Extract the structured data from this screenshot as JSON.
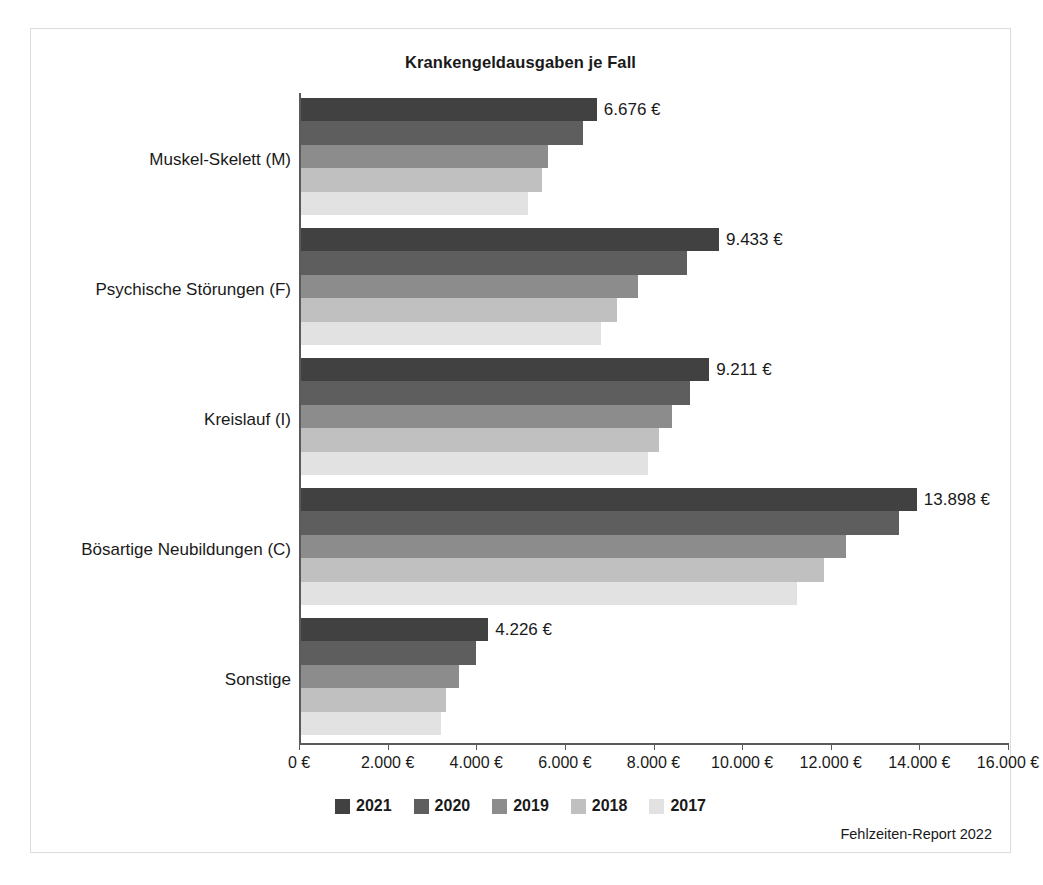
{
  "chart_data": {
    "type": "bar",
    "orientation": "horizontal",
    "title": "Krankengeldausgaben je Fall",
    "xlabel": "",
    "ylabel": "",
    "xlim": [
      0,
      16000
    ],
    "xticks": [
      0,
      2000,
      4000,
      6000,
      8000,
      10000,
      12000,
      14000,
      16000
    ],
    "xticklabels": [
      "0 €",
      "2.000 €",
      "4.000 €",
      "6.000 €",
      "8.000 €",
      "10.000 €",
      "12.000 €",
      "14.000 €",
      "16.000 €"
    ],
    "grid": false,
    "legend_position": "bottom",
    "categories": [
      "Muskel-Skelett (M)",
      "Psychische Störungen (F)",
      "Kreislauf (I)",
      "Bösartige Neubildungen (C)",
      "Sonstige"
    ],
    "series": [
      {
        "name": "2021",
        "color": "#414141",
        "values": [
          6676,
          9433,
          9211,
          13898,
          4226
        ],
        "value_labels": [
          "6.676 €",
          "9.433 €",
          "9.211 €",
          "13.898 €",
          "4.226 €"
        ]
      },
      {
        "name": "2020",
        "color": "#5e5e5e",
        "values": [
          6360,
          8700,
          8780,
          13500,
          3950
        ],
        "value_labels": [
          "",
          "",
          "",
          "",
          ""
        ]
      },
      {
        "name": "2019",
        "color": "#8c8c8c",
        "values": [
          5580,
          7610,
          8370,
          12300,
          3570
        ],
        "value_labels": [
          "",
          "",
          "",
          "",
          ""
        ]
      },
      {
        "name": "2018",
        "color": "#c0c0c0",
        "values": [
          5440,
          7120,
          8090,
          11800,
          3270
        ],
        "value_labels": [
          "",
          "",
          "",
          "",
          ""
        ]
      },
      {
        "name": "2017",
        "color": "#e2e2e2",
        "values": [
          5130,
          6770,
          7830,
          11200,
          3150
        ],
        "value_labels": [
          "",
          "",
          "",
          "",
          ""
        ]
      }
    ]
  },
  "source": {
    "text": "Fehlzeiten-Report 2022"
  }
}
